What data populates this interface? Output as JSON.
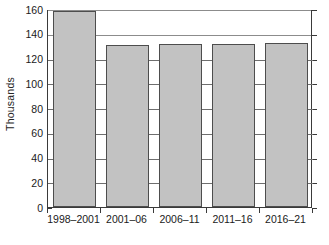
{
  "chart_data": {
    "type": "bar",
    "title": "",
    "xlabel": "",
    "ylabel": "Thousands",
    "categories": [
      "1998–2001",
      "2001–06",
      "2006–11",
      "2011–16",
      "2016–21"
    ],
    "values": [
      158,
      131,
      131.5,
      132,
      132.5
    ],
    "ylim": [
      0,
      160
    ],
    "ytick_values": [
      0,
      20,
      40,
      60,
      80,
      100,
      120,
      140,
      160
    ],
    "ytick_labels": [
      "0",
      "20",
      "40",
      "60",
      "80",
      "100",
      "120",
      "140",
      "160"
    ],
    "grid": true,
    "grid_axis": "y",
    "legend": false,
    "legend_position": "none",
    "bar_fill_color": "#c2c2c2",
    "bar_border_color": "#4d4d4d",
    "gridline_color": "#6e6e6e",
    "axis_color": "#3a3a3a",
    "background_color": "#ffffff"
  }
}
